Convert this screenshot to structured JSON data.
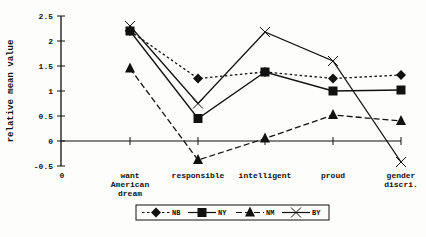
{
  "chart_data": {
    "type": "line",
    "title": "",
    "xlabel": "",
    "ylabel": "relative mean value",
    "ylim": [
      -0.5,
      2.5
    ],
    "yticks": [
      2.5,
      2,
      1.5,
      1,
      0.5,
      0,
      -0.5
    ],
    "ytick_labels": [
      "2.5",
      "2",
      "1.5",
      "1",
      "0.5",
      "0",
      "-0.5"
    ],
    "x_origin_label": "0",
    "categories": [
      [
        "want",
        "American",
        "dream"
      ],
      [
        "responsible"
      ],
      [
        "intelligent"
      ],
      [
        "proud"
      ],
      [
        "gender",
        "discri."
      ]
    ],
    "category_names": [
      "want American dream",
      "responsible",
      "intelligent",
      "proud",
      "gender discri."
    ],
    "grid": false,
    "legend_position": "bottom",
    "series": [
      {
        "name": "NB",
        "marker": "diamond",
        "line": "dotted",
        "values": [
          2.2,
          1.25,
          1.38,
          1.25,
          1.32
        ]
      },
      {
        "name": "NY",
        "marker": "square",
        "line": "solid",
        "values": [
          2.2,
          0.45,
          1.38,
          1.0,
          1.02
        ]
      },
      {
        "name": "NM",
        "marker": "triangle",
        "line": "dashed",
        "values": [
          1.45,
          -0.38,
          0.05,
          0.52,
          0.4
        ]
      },
      {
        "name": "BY",
        "marker": "x",
        "line": "solid",
        "values": [
          2.3,
          0.75,
          2.18,
          1.6,
          -0.42
        ]
      }
    ]
  },
  "colors": {
    "ink": "#111111",
    "background": "#fdfdfb"
  }
}
